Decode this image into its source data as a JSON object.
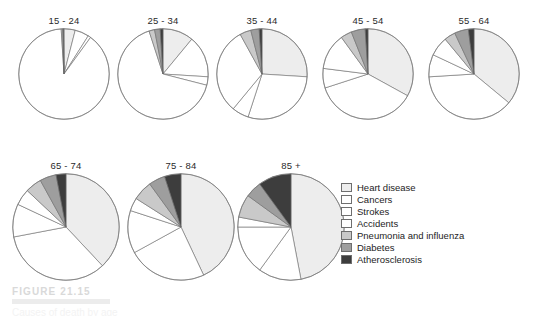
{
  "figure": {
    "caption_label": "FIGURE 21.15",
    "caption_subtitle": "Causes of death by age"
  },
  "legend": {
    "position": "right-middle",
    "items": [
      {
        "label": "Heart disease",
        "color": "#ededed"
      },
      {
        "label": "Cancers",
        "color": "#ffffff"
      },
      {
        "label": "Strokes",
        "color": "#ffffff"
      },
      {
        "label": "Accidents",
        "color": "#ffffff"
      },
      {
        "label": "Pneumonia and influenza",
        "color": "#c9c9c9"
      },
      {
        "label": "Diabetes",
        "color": "#9e9e9e"
      },
      {
        "label": "Atherosclerosis",
        "color": "#3d3d3d"
      }
    ]
  },
  "chart_data": {
    "type": "pie",
    "title": "FIGURE 21.15",
    "xlabel": "",
    "ylabel": "",
    "categories": [
      "Heart disease",
      "Cancers",
      "Strokes",
      "Accidents",
      "Pneumonia and influenza",
      "Diabetes",
      "Atherosclerosis"
    ],
    "colors": [
      "#ededed",
      "#ffffff",
      "#ffffff",
      "#ffffff",
      "#c9c9c9",
      "#9e9e9e",
      "#3d3d3d"
    ],
    "units": "percent of deaths",
    "charts": [
      {
        "label": "15 - 24",
        "row": 0,
        "values": [
          4,
          5,
          1,
          89,
          0.5,
          0.3,
          0.2
        ]
      },
      {
        "label": "25 - 34",
        "row": 0,
        "values": [
          11,
          15,
          3,
          66,
          2,
          2,
          1
        ]
      },
      {
        "label": "35 - 44",
        "row": 0,
        "values": [
          26,
          29,
          6,
          31,
          4,
          3,
          1
        ]
      },
      {
        "label": "45 - 54",
        "row": 0,
        "values": [
          33,
          37,
          7,
          13,
          4,
          5,
          1
        ]
      },
      {
        "label": "55 - 64",
        "row": 0,
        "values": [
          36,
          38,
          8,
          7,
          4,
          5,
          2
        ]
      },
      {
        "label": "65 - 74",
        "row": 1,
        "values": [
          38,
          34,
          10,
          5,
          5,
          5,
          3
        ]
      },
      {
        "label": "75 - 84",
        "row": 1,
        "values": [
          43,
          24,
          13,
          4,
          6,
          5,
          5
        ]
      },
      {
        "label": "85 +",
        "row": 1,
        "values": [
          47,
          13,
          15,
          3,
          7,
          5,
          10
        ]
      }
    ]
  },
  "layout": {
    "row0": {
      "top": 14,
      "diameter": 92,
      "lefts": [
        18,
        117,
        216,
        322,
        428
      ]
    },
    "row1": {
      "top": 159,
      "diameter": 108,
      "lefts": [
        12,
        127,
        237
      ]
    }
  }
}
